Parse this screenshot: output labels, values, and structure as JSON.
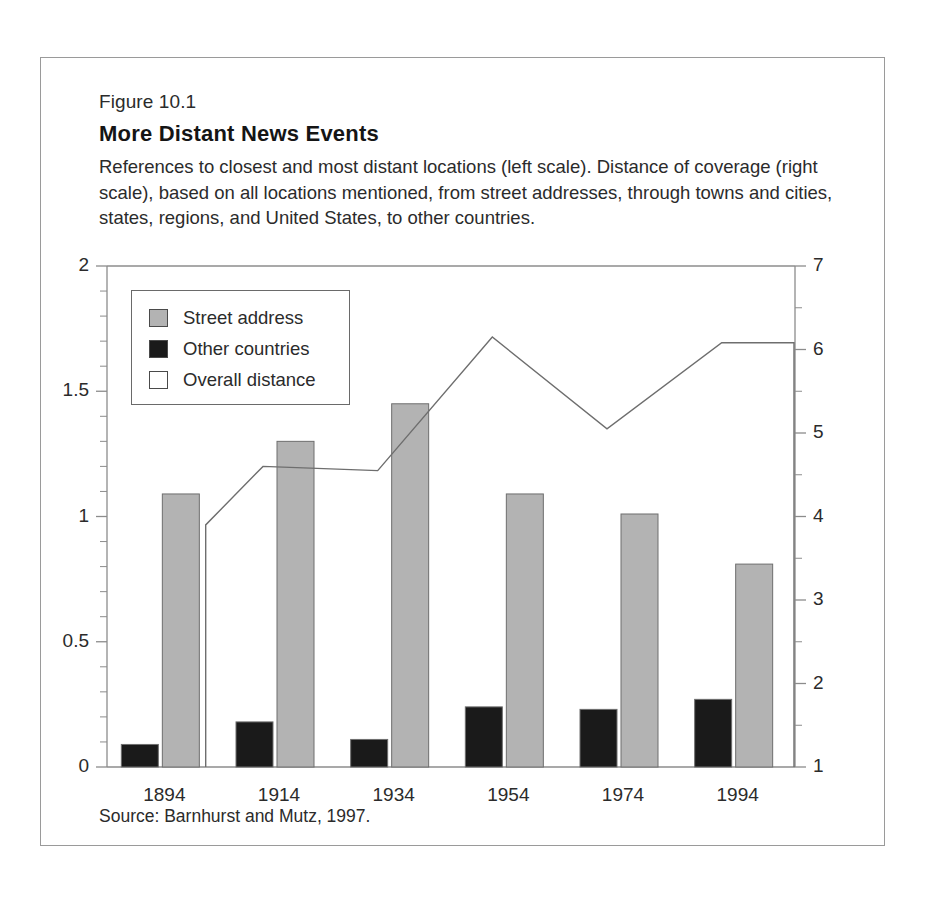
{
  "figure": {
    "number": "Figure 10.1",
    "title": "More Distant News Events",
    "caption": "References to closest and most distant locations (left scale). Distance of coverage (right scale), based on all locations mentioned, from street addresses, through towns and cities, states, regions, and United States, to other countries.",
    "source": "Source: Barnhurst and Mutz, 1997."
  },
  "legend": {
    "position": "inside-top-left",
    "items": [
      {
        "label": "Street address",
        "swatch": "gray",
        "color": "#b3b3b3"
      },
      {
        "label": "Other countries",
        "swatch": "black",
        "color": "#1a1a1a"
      },
      {
        "label": "Overall distance",
        "swatch": "white",
        "color": "#ffffff"
      }
    ]
  },
  "colors": {
    "street_address": "#b3b3b3",
    "other_countries": "#1a1a1a",
    "overall_distance_line": "#6e6e6e",
    "axis": "#8c8c8c",
    "bar_outline": "#6e6e6e",
    "frame": "#9a9a9a",
    "text": "#2b2b2b"
  },
  "chart_data": {
    "type": "bar",
    "title": "More Distant News Events",
    "subtitle": "References to closest and most distant locations (left scale). Distance of coverage (right scale), based on all locations mentioned, from street addresses, through towns and cities, states, regions, and United States, to other countries.",
    "xlabel": "",
    "ylabel": "",
    "categories": [
      "1894",
      "1914",
      "1934",
      "1954",
      "1974",
      "1994"
    ],
    "grid": false,
    "legend_position": "upper left",
    "axes": {
      "left": {
        "label": "",
        "ylim": [
          0,
          2
        ],
        "ticks": [
          "0",
          "0.5",
          "1",
          "1.5",
          "2"
        ],
        "tick_values": [
          0,
          0.5,
          1,
          1.5,
          2
        ],
        "minor_tick_step": 0.1,
        "applies_to": [
          "Street address",
          "Other countries"
        ]
      },
      "right": {
        "label": "",
        "ylim": [
          1,
          7
        ],
        "ticks": [
          "1",
          "2",
          "3",
          "4",
          "5",
          "6",
          "7"
        ],
        "tick_values": [
          1,
          2,
          3,
          4,
          5,
          6,
          7
        ],
        "minor_tick_step": 0.5,
        "applies_to": [
          "Overall distance"
        ]
      },
      "x": {
        "ticks": [
          "1894",
          "1914",
          "1934",
          "1954",
          "1974",
          "1994"
        ]
      }
    },
    "series": [
      {
        "name": "Other countries",
        "kind": "bar",
        "axis": "left",
        "color": "#1a1a1a",
        "values": [
          0.09,
          0.18,
          0.11,
          0.24,
          0.23,
          0.27
        ]
      },
      {
        "name": "Street address",
        "kind": "bar",
        "axis": "left",
        "color": "#b3b3b3",
        "values": [
          1.09,
          1.3,
          1.45,
          1.09,
          1.01,
          0.81
        ]
      },
      {
        "name": "Overall distance",
        "kind": "line",
        "axis": "right",
        "color": "#6e6e6e",
        "values": [
          3.9,
          4.6,
          4.55,
          6.15,
          5.05,
          6.08
        ]
      }
    ]
  }
}
